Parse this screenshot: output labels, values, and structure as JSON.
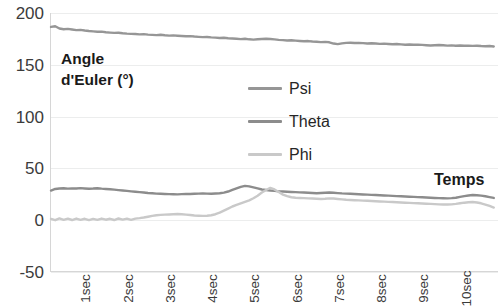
{
  "chart_data": {
    "type": "line",
    "title": "",
    "xlabel": "Temps",
    "ylabel": "Angle d'Euler (°)",
    "ylim": [
      -50,
      200
    ],
    "y_ticks": [
      200,
      150,
      100,
      50,
      0,
      -50
    ],
    "xlim": [
      0,
      10.6
    ],
    "x_tick_labels": [
      "1sec",
      "2sec",
      "3sec",
      "4sec",
      "5sec",
      "6sec",
      "7sec",
      "8sec",
      "9sec",
      "10sec"
    ],
    "x_tick_values": [
      1,
      2,
      3,
      4,
      5,
      6,
      7,
      8,
      9,
      10
    ],
    "grid": true,
    "legend_position": "center",
    "colors": {
      "psi": "#969696",
      "theta": "#8c8c8c",
      "phi": "#c9c9c9",
      "gridline": "#eceded",
      "axis": "#d6d6d6"
    },
    "x": [
      0.0,
      0.1,
      0.2,
      0.3,
      0.4,
      0.5,
      0.6,
      0.7,
      0.8,
      0.9,
      1.0,
      1.1,
      1.2,
      1.3,
      1.4,
      1.5,
      1.6,
      1.7,
      1.8,
      1.9,
      2.0,
      2.1,
      2.2,
      2.3,
      2.4,
      2.5,
      2.6,
      2.7,
      2.8,
      2.9,
      3.0,
      3.1,
      3.2,
      3.3,
      3.4,
      3.5,
      3.6,
      3.7,
      3.8,
      3.9,
      4.0,
      4.1,
      4.2,
      4.3,
      4.4,
      4.5,
      4.6,
      4.7,
      4.8,
      4.9,
      5.0,
      5.1,
      5.2,
      5.3,
      5.4,
      5.5,
      5.6,
      5.7,
      5.8,
      5.9,
      6.0,
      6.1,
      6.2,
      6.3,
      6.4,
      6.5,
      6.6,
      6.7,
      6.8,
      6.9,
      7.0,
      7.1,
      7.2,
      7.3,
      7.4,
      7.5,
      7.6,
      7.7,
      7.8,
      7.9,
      8.0,
      8.1,
      8.2,
      8.3,
      8.4,
      8.5,
      8.6,
      8.7,
      8.8,
      8.9,
      9.0,
      9.1,
      9.2,
      9.3,
      9.4,
      9.5,
      9.6,
      9.7,
      9.8,
      9.9,
      10.0,
      10.1,
      10.2,
      10.3,
      10.4,
      10.5
    ],
    "series": [
      {
        "name": "Psi",
        "color": "#969696",
        "values": [
          186.5,
          187.2,
          185.0,
          184.3,
          184.6,
          184.0,
          183.4,
          183.6,
          183.0,
          182.5,
          182.2,
          181.8,
          181.9,
          181.3,
          181.0,
          180.7,
          180.9,
          180.4,
          180.0,
          179.8,
          179.6,
          179.3,
          179.5,
          179.0,
          178.8,
          178.6,
          178.9,
          178.4,
          178.1,
          178.3,
          178.0,
          177.7,
          177.4,
          177.6,
          177.2,
          176.9,
          176.6,
          176.8,
          176.4,
          176.1,
          175.8,
          176.0,
          175.6,
          175.3,
          175.0,
          174.7,
          175.0,
          174.5,
          174.2,
          174.5,
          174.8,
          175.1,
          174.8,
          174.4,
          174.0,
          173.7,
          173.4,
          173.6,
          173.2,
          172.9,
          172.6,
          172.8,
          172.4,
          172.1,
          171.8,
          172.0,
          171.6,
          170.4,
          169.8,
          170.6,
          171.0,
          171.2,
          170.9,
          171.1,
          170.8,
          170.5,
          170.7,
          170.4,
          170.1,
          170.3,
          170.0,
          169.7,
          169.9,
          169.6,
          169.3,
          169.5,
          169.2,
          169.4,
          169.1,
          168.8,
          168.5,
          168.8,
          169.0,
          168.7,
          168.4,
          168.6,
          168.3,
          168.5,
          168.2,
          168.4,
          168.1,
          168.3,
          168.0,
          167.8,
          168.0,
          167.6
        ]
      },
      {
        "name": "Theta",
        "color": "#8c8c8c",
        "values": [
          28.0,
          29.5,
          30.0,
          30.2,
          29.8,
          30.1,
          29.9,
          30.3,
          30.0,
          29.7,
          29.9,
          30.2,
          29.8,
          29.5,
          29.2,
          28.8,
          28.4,
          28.0,
          27.6,
          27.2,
          26.8,
          26.4,
          26.0,
          25.6,
          25.3,
          25.0,
          24.8,
          24.6,
          24.5,
          24.4,
          24.3,
          24.5,
          24.7,
          24.6,
          24.8,
          25.0,
          25.2,
          25.0,
          24.8,
          25.1,
          25.4,
          26.0,
          27.0,
          28.5,
          30.0,
          31.5,
          32.5,
          32.0,
          31.0,
          30.0,
          29.0,
          28.5,
          28.0,
          27.6,
          27.2,
          27.0,
          26.8,
          26.6,
          26.4,
          26.2,
          26.0,
          25.8,
          25.6,
          25.4,
          25.6,
          25.8,
          26.0,
          25.8,
          25.5,
          25.2,
          25.0,
          24.8,
          24.6,
          24.4,
          24.2,
          24.0,
          23.8,
          23.6,
          23.4,
          23.2,
          23.0,
          22.8,
          22.6,
          22.4,
          22.2,
          22.0,
          21.8,
          21.6,
          21.4,
          21.2,
          21.0,
          20.8,
          20.6,
          20.5,
          20.4,
          20.6,
          21.0,
          21.8,
          22.6,
          23.2,
          23.6,
          23.4,
          23.0,
          22.4,
          21.6,
          20.8
        ]
      },
      {
        "name": "Phi",
        "color": "#c9c9c9",
        "values": [
          0.5,
          -0.8,
          0.9,
          -0.5,
          0.7,
          -0.6,
          0.8,
          -0.4,
          0.6,
          -0.7,
          0.5,
          -0.5,
          0.8,
          -0.3,
          0.6,
          -0.6,
          0.9,
          -0.2,
          0.7,
          -0.5,
          0.8,
          1.2,
          1.8,
          2.6,
          3.4,
          4.0,
          4.4,
          4.6,
          4.8,
          5.0,
          5.2,
          5.0,
          4.6,
          4.2,
          3.8,
          3.6,
          3.4,
          3.6,
          4.0,
          5.0,
          6.5,
          8.5,
          10.5,
          12.5,
          14.0,
          15.5,
          17.0,
          18.5,
          20.5,
          23.0,
          26.0,
          28.5,
          30.5,
          29.0,
          26.5,
          24.0,
          22.5,
          21.5,
          21.0,
          20.8,
          20.6,
          20.4,
          20.2,
          20.0,
          19.8,
          20.0,
          20.4,
          20.2,
          19.8,
          19.4,
          19.0,
          18.8,
          18.6,
          18.4,
          18.2,
          18.0,
          17.8,
          17.6,
          17.4,
          17.2,
          17.0,
          16.8,
          16.6,
          16.4,
          16.2,
          16.0,
          15.8,
          15.6,
          15.4,
          15.2,
          15.0,
          14.8,
          14.6,
          14.5,
          14.4,
          14.6,
          15.0,
          15.6,
          16.2,
          16.6,
          16.8,
          16.4,
          15.6,
          14.4,
          13.0,
          11.5
        ]
      }
    ]
  },
  "legend": {
    "items": [
      {
        "label": "Psi"
      },
      {
        "label": "Theta"
      },
      {
        "label": "Phi"
      }
    ]
  },
  "axes": {
    "y_title": "Angle\nd'Euler (°)",
    "x_title": "Temps"
  }
}
